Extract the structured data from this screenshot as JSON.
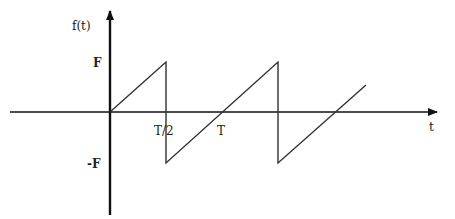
{
  "diagram": {
    "y_axis_label": "f(t)",
    "x_axis_label": "t",
    "y_ticks": {
      "pos": "F",
      "neg": "-F"
    },
    "x_ticks": {
      "half": "T/2",
      "full": "T"
    },
    "colors": {
      "line": "#333333",
      "axis": "#111111",
      "background": "#ffffff"
    }
  }
}
